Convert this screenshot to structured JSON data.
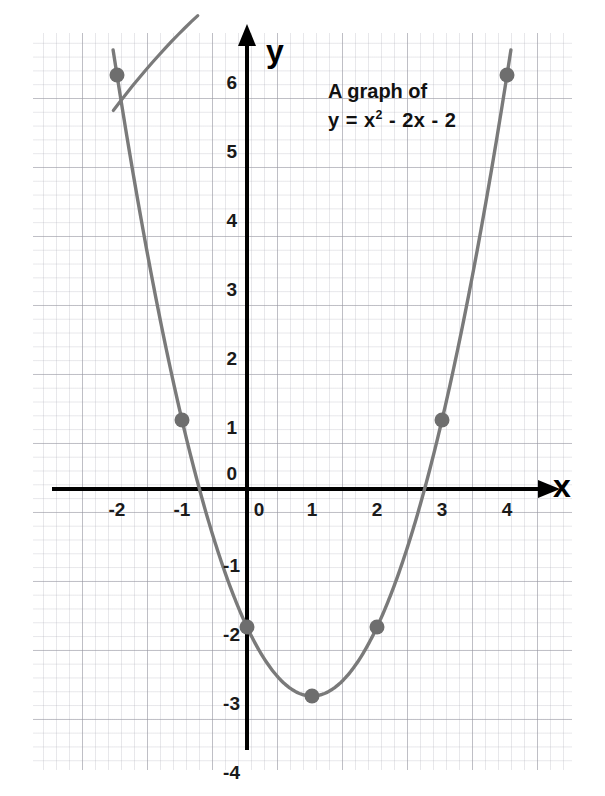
{
  "annotation": {
    "line1": "A graph of",
    "line2_prefix": "y = x",
    "line2_exponent": "2",
    "line2_suffix": " - 2x - 2"
  },
  "axes": {
    "x_name": "x",
    "y_name": "y",
    "x_ticks": [
      "-2",
      "-1",
      "0",
      "1",
      "2",
      "3",
      "4"
    ],
    "y_ticks": [
      "6",
      "5",
      "4",
      "3",
      "2",
      "1",
      "0",
      "-1",
      "-2",
      "-3",
      "-4"
    ],
    "axis_color": "#000000"
  },
  "colors": {
    "curve": "#7a7a7a",
    "point": "#6e6e6e",
    "grid_minor": "#b2b2bc",
    "grid_major": "#9696a0",
    "background": "#ffffff",
    "text": "#1a1a1a"
  },
  "chart_data": {
    "type": "line",
    "equation": "y = x^2 - 2x - 2",
    "xlabel": "x",
    "ylabel": "y",
    "xlim": [
      -2.2,
      4.4
    ],
    "ylim": [
      -4.1,
      6.5
    ],
    "xticks": [
      -2,
      -1,
      0,
      1,
      2,
      3,
      4
    ],
    "yticks": [
      6,
      5,
      4,
      3,
      2,
      1,
      0,
      -1,
      -2,
      -3,
      -4
    ],
    "grid": true,
    "legend": "none",
    "marked_points": [
      {
        "x": -2,
        "y": 6
      },
      {
        "x": -1,
        "y": 1
      },
      {
        "x": 0,
        "y": -2
      },
      {
        "x": 1,
        "y": -3
      },
      {
        "x": 2,
        "y": -2
      },
      {
        "x": 3,
        "y": 1
      },
      {
        "x": 4,
        "y": 6
      }
    ],
    "x": [
      -2,
      -1,
      0,
      1,
      2,
      3,
      4
    ],
    "values": [
      6,
      1,
      -2,
      -3,
      -2,
      1,
      6
    ]
  }
}
